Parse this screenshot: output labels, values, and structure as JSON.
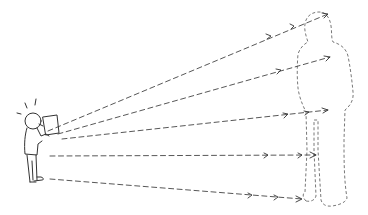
{
  "illustration": {
    "description": "Sketch of a small person holding a sheet up to their face, with dashed arrows projecting onto a large dashed-outline silhouette of a person",
    "colors": {
      "line": "#333333",
      "background": "#ffffff"
    },
    "person": {
      "icon": "person-holding-paper-icon"
    },
    "silhouette": {
      "icon": "dashed-silhouette-icon"
    },
    "arrows": [
      {
        "from": [
          48,
          130
        ],
        "to": [
          330,
          14
        ]
      },
      {
        "from": [
          58,
          133
        ],
        "to": [
          330,
          56
        ]
      },
      {
        "from": [
          60,
          138
        ],
        "to": [
          330,
          112
        ]
      },
      {
        "from": [
          48,
          156
        ],
        "to": [
          318,
          155
        ]
      },
      {
        "from": [
          50,
          179
        ],
        "to": [
          306,
          198
        ]
      }
    ]
  }
}
